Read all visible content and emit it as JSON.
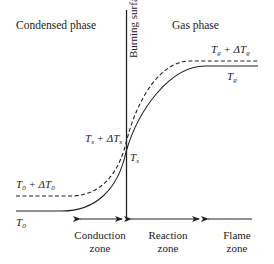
{
  "diagram": {
    "title_left": "Condensed phase",
    "title_right": "Gas phase",
    "surface_label": "Burning surface",
    "curve_labels": {
      "Tg_plus": {
        "T": "T",
        "sub": "g",
        "plus": " + ΔT",
        "sub2": "g"
      },
      "Tg": {
        "T": "T",
        "sub": "g"
      },
      "Ts_plus": {
        "T": "T",
        "sub": "s",
        "plus": " + ΔT",
        "sub2": "s"
      },
      "Ts": {
        "T": "T",
        "sub": "s"
      },
      "T0_plus": {
        "T": "T",
        "sub": "0",
        "plus": " + ΔT",
        "sub2": "0"
      },
      "T0": {
        "T": "T",
        "sub": "0"
      }
    },
    "zones": [
      {
        "line1": "Conduction",
        "line2": "zone"
      },
      {
        "line1": "Reaction",
        "line2": "zone"
      },
      {
        "line1": "Flame",
        "line2": "zone"
      }
    ],
    "curves": [
      {
        "name": "temperature-profile",
        "style": "solid"
      },
      {
        "name": "perturbed-temperature-profile",
        "style": "dashed"
      }
    ],
    "colors": {
      "line": "#222222",
      "background": "#ffffff"
    }
  }
}
